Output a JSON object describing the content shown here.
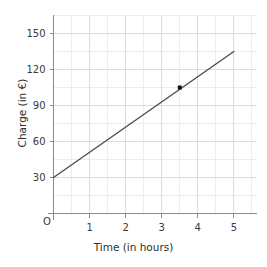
{
  "chart_data": {
    "type": "line",
    "title": "",
    "xlabel": "Time (in hours)",
    "ylabel": "Charge (in €)",
    "origin_label": "O",
    "xlim": [
      0,
      5.6
    ],
    "ylim": [
      0,
      165
    ],
    "grid": true,
    "legend": null,
    "x_ticks": [
      1,
      2,
      3,
      4,
      5
    ],
    "x_tick_labels": [
      "1",
      "2",
      "3",
      "4",
      "5"
    ],
    "x_minor_step": 0.5,
    "y_ticks": [
      30,
      60,
      90,
      120,
      150
    ],
    "y_tick_labels": [
      "30",
      "60",
      "90",
      "120",
      "150"
    ],
    "y_minor_step": 15,
    "series": [
      {
        "name": "Charge",
        "type": "line",
        "x": [
          0,
          5
        ],
        "y": [
          30,
          135
        ],
        "slope": 21,
        "intercept": 30,
        "color": "#4d4d4d",
        "width": 1.4
      }
    ],
    "points": [
      {
        "x": 3.5,
        "y": 105,
        "marker": "square",
        "color": "#111111",
        "size": 4
      }
    ],
    "colors": {
      "line": "#4d4d4d",
      "point": "#111111",
      "axis": "#8a8a8a",
      "grid_major": "#dcdcdc",
      "grid_minor": "#ededed",
      "text": "#3a3a3a",
      "background": "#ffffff"
    }
  }
}
